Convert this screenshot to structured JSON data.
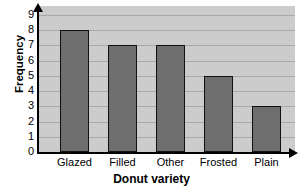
{
  "chart_data": {
    "type": "bar",
    "title": "",
    "categories": [
      "Glazed",
      "Filled",
      "Other",
      "Frosted",
      "Plain"
    ],
    "values": [
      8,
      7,
      7,
      5,
      3
    ],
    "xlabel": "Donut variety",
    "ylabel": "Frequency",
    "ylim": [
      0,
      9
    ],
    "ytick_labels": [
      "0",
      "1",
      "2",
      "3",
      "4",
      "5",
      "6",
      "7",
      "8",
      "9"
    ],
    "ytick_values": [
      0,
      1,
      2,
      3,
      4,
      5,
      6,
      7,
      8,
      9
    ],
    "grid": "horizontal",
    "legend": "none",
    "colors": {
      "bar_fill": "#6e6e6e",
      "bar_edge": "#111111",
      "plot_background": "#cccccc",
      "gridline": "#a8a8a8",
      "axis": "#000000",
      "page_background": "#ffffff",
      "text": "#000000"
    },
    "axis_arrows": {
      "y_axis_arrow": "arrow-up-icon",
      "x_axis_arrow": "arrow-right-icon"
    }
  }
}
